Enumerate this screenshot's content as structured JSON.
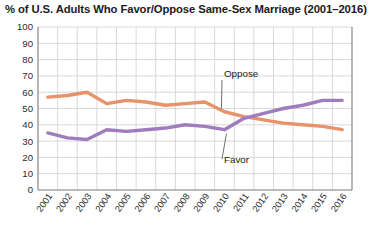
{
  "chart_data": {
    "type": "line",
    "title": "% of U.S. Adults Who Favor/Oppose Same-Sex Marriage (2001–2016)",
    "xlabel": "",
    "ylabel": "",
    "ylim": [
      0,
      100
    ],
    "ytick_step": 10,
    "yticks": [
      "100",
      "90",
      "80",
      "70",
      "60",
      "50",
      "40",
      "30",
      "20",
      "10",
      "0"
    ],
    "categories": [
      "2001",
      "2002",
      "2003",
      "2004",
      "2005",
      "2006",
      "2007",
      "2008",
      "2009",
      "2010",
      "2011",
      "2012",
      "2013",
      "2014",
      "2015",
      "2016"
    ],
    "grid": true,
    "legend_position": "inline-annotations",
    "series": [
      {
        "name": "Oppose",
        "color": "#e8926a",
        "values": [
          57,
          58,
          60,
          53,
          55,
          54,
          52,
          53,
          54,
          48,
          45,
          43,
          41,
          40,
          39,
          37
        ]
      },
      {
        "name": "Favor",
        "color": "#9f7cbe",
        "values": [
          35,
          32,
          31,
          37,
          36,
          37,
          38,
          40,
          39,
          37,
          44,
          47,
          50,
          52,
          55,
          55
        ]
      }
    ],
    "annotations": [
      {
        "text": "Oppose",
        "series": "Oppose"
      },
      {
        "text": "Favor",
        "series": "Favor"
      }
    ]
  },
  "colors": {
    "oppose": "#e8926a",
    "favor": "#9f7cbe",
    "grid": "#c8c8c8",
    "axis": "#8a8a8a",
    "text": "#1b1b1b",
    "background": "#ffffff"
  }
}
